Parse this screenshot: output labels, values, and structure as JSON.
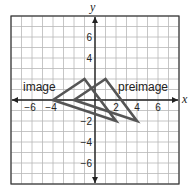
{
  "chart_data": {
    "type": "diagram",
    "xlabel": "x",
    "ylabel": "y",
    "xlim": [
      -8,
      8
    ],
    "ylim": [
      -8,
      8
    ],
    "grid": true,
    "x_ticks": [
      -6,
      -4,
      2,
      4,
      6
    ],
    "y_ticks": [
      6,
      4,
      -2,
      -4,
      -6
    ],
    "shapes": [
      {
        "name": "preimage",
        "label": "preimage",
        "vertices": [
          [
            -2,
            0
          ],
          [
            1,
            2
          ],
          [
            4,
            -2
          ]
        ]
      },
      {
        "name": "image",
        "label": "image",
        "vertices": [
          [
            -4,
            0
          ],
          [
            -1,
            2
          ],
          [
            2,
            -2
          ]
        ]
      }
    ]
  },
  "labels": {
    "x_axis": "x",
    "y_axis": "y",
    "image": "image",
    "preimage": "preimage"
  },
  "colors": {
    "grid": "#b8b8b8",
    "axis": "#222222",
    "shape": "#555555",
    "frame": "#333333"
  }
}
